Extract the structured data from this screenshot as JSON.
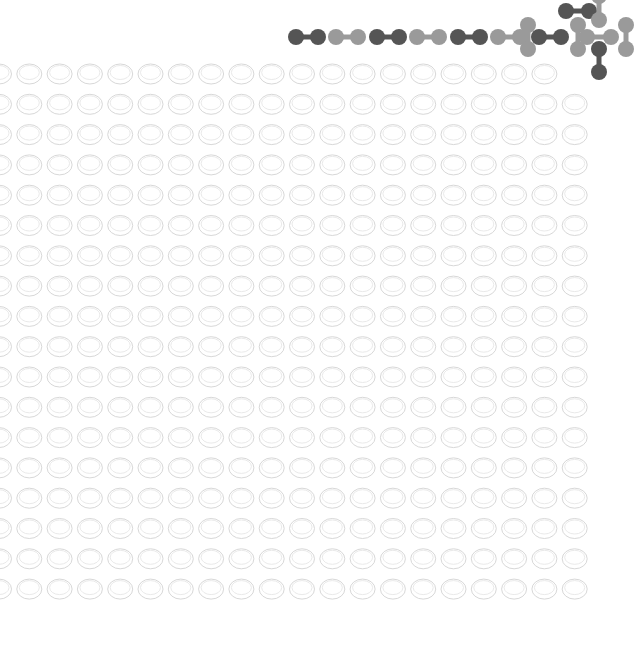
{
  "graphic": {
    "kind": "decorative-pattern",
    "background": "#ffffff",
    "oval_grid": {
      "rows": 18,
      "cols": 20,
      "x0": 0,
      "y0": 74,
      "dx": 30.3,
      "dy": 30.3,
      "rx": 12.5,
      "ry": 10,
      "stroke": "#d8d8d8"
    },
    "molecule_colors": {
      "dark": "#555555",
      "light": "#9a9a9a"
    },
    "chain": [
      {
        "x": 296,
        "y": 37,
        "tone": "dark"
      },
      {
        "x": 336,
        "y": 37,
        "tone": "light"
      },
      {
        "x": 377,
        "y": 37,
        "tone": "dark"
      },
      {
        "x": 417,
        "y": 37,
        "tone": "light"
      },
      {
        "x": 458,
        "y": 37,
        "tone": "dark"
      },
      {
        "x": 498,
        "y": 37,
        "tone": "light"
      },
      {
        "x": 539,
        "y": 37,
        "tone": "dark"
      }
    ],
    "cluster": [
      {
        "x1": 566,
        "y1": 11,
        "x2": 589,
        "y2": 11,
        "tone": "dark"
      },
      {
        "x1": 599,
        "y1": -4,
        "x2": 599,
        "y2": 20,
        "tone": "light"
      },
      {
        "x1": 528,
        "y1": 25,
        "x2": 528,
        "y2": 49,
        "tone": "light"
      },
      {
        "x1": 578,
        "y1": 25,
        "x2": 578,
        "y2": 49,
        "tone": "light"
      },
      {
        "x1": 587,
        "y1": 37,
        "x2": 611,
        "y2": 37,
        "tone": "light"
      },
      {
        "x1": 626,
        "y1": 25,
        "x2": 626,
        "y2": 49,
        "tone": "light"
      },
      {
        "x1": 599,
        "y1": 49,
        "x2": 599,
        "y2": 72,
        "tone": "dark"
      }
    ]
  }
}
